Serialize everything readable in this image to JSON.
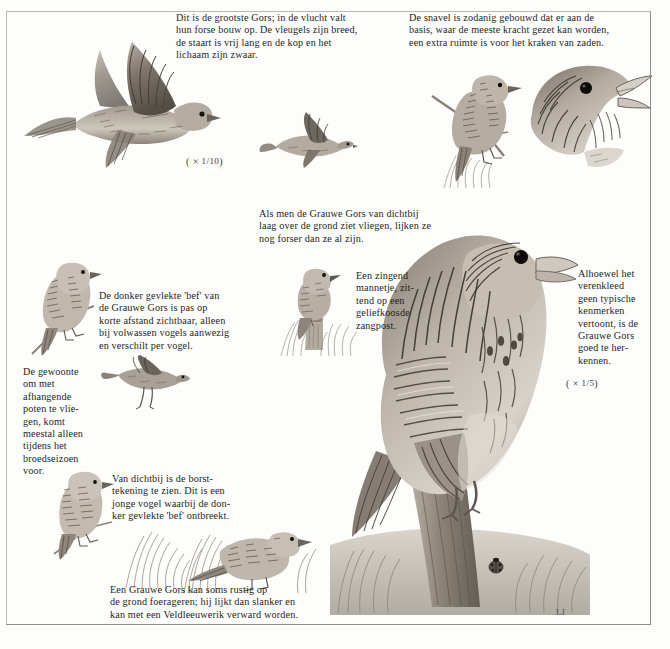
{
  "page": {
    "language": "nl"
  },
  "captions": [
    {
      "id": "flight-large",
      "text": "Dit is de grootste Gors; in de vlucht valt\nhun forse bouw op. De vleugels zijn breed,\nde staart is vrij lang en de kop en het\nlichaam zijn zwaar."
    },
    {
      "id": "bill-structure",
      "text": "De snavel is zodanig gebouwd dat er aan de\nbasis, waar de meeste kracht gezet kan worden,\neen extra ruimte is voor het kraken van zaden."
    },
    {
      "id": "low-flight",
      "text": "Als men de Grauwe Gors van dichtbij\nlaag over de grond ziet vliegen, lijken ze\nnog forser dan ze al zijn."
    },
    {
      "id": "dark-bib",
      "text": "De donker gevlekte 'bef' van\nde Grauwe Gors is pas op\nkorte afstand zichtbaar, alleen\nbij volwassen vogels aanwezig\nen verschilt per  vogel."
    },
    {
      "id": "dangling-legs",
      "text": "De gewoonte\nom met\nafhangende\npoten te vlie-\ngen, komt\nmeestal alleen\ntijdens het\nbroedseizoen\nvoor."
    },
    {
      "id": "singing-male",
      "text": "Een zingend\nmannetje, zit-\ntend op een\ngeliefkoosde\nzangpost."
    },
    {
      "id": "plumage-recognition",
      "text": "Alhoewel het\nverenkleed\ngeen typische\nkenmerken\nvertoont, is de\nGrauwe Gors\ngoed te her-\nkennen."
    },
    {
      "id": "breast-markings",
      "text": "Van dichtbij is de borst-\ntekening te zien. Dit is een\njonge vogel waarbij de don-\nker gevlekte 'bef' ontbreekt."
    },
    {
      "id": "ground-foraging",
      "text": "Een Grauwe Gors kan soms rustig op\nde grond foerageren; hij lijkt dan slanker en\nkan met een Veldleeuwerik verward worden."
    }
  ],
  "scales": [
    {
      "id": "scale-flight",
      "prefix": "( ×",
      "fraction": "1/10",
      "suffix": ")"
    },
    {
      "id": "scale-perched",
      "prefix": "( ×",
      "fraction": "1/5",
      "suffix": ")"
    }
  ],
  "signature": {
    "text": "LJ"
  },
  "illustrations": [
    {
      "id": "corn-bunting-flight-large",
      "label": "Grauwe Gors in vlucht, groot"
    },
    {
      "id": "corn-bunting-flight-small",
      "label": "Grauwe Gors in vlucht, klein"
    },
    {
      "id": "corn-bunting-head-profile",
      "label": "Kop van Grauwe Gors, snavelbouw"
    },
    {
      "id": "corn-bunting-perched-twig",
      "label": "Grauwe Gors op takje"
    },
    {
      "id": "corn-bunting-perched-branch-left",
      "label": "Grauwe Gors op tak links"
    },
    {
      "id": "corn-bunting-flight-dangling-legs",
      "label": "Grauwe Gors vliegend met afhangende poten"
    },
    {
      "id": "corn-bunting-singing-post",
      "label": "Zingend mannetje op paaltje"
    },
    {
      "id": "corn-bunting-main-perched",
      "label": "Grauwe Gors groot op paal"
    },
    {
      "id": "corn-bunting-juvenile-perched",
      "label": "Jonge Grauwe Gors op takje"
    },
    {
      "id": "corn-bunting-ground-foraging",
      "label": "Grauwe Gors foeragerend op de grond"
    },
    {
      "id": "ladybird",
      "label": "Lieveheersbeestje"
    }
  ],
  "colors": {
    "paper": "#fdfdfc",
    "ink": "#231f1d",
    "frame": "#b9b9b4",
    "plumage_dark": "#4a443e",
    "plumage_mid": "#8e8379",
    "plumage_light": "#c9c1b6"
  }
}
